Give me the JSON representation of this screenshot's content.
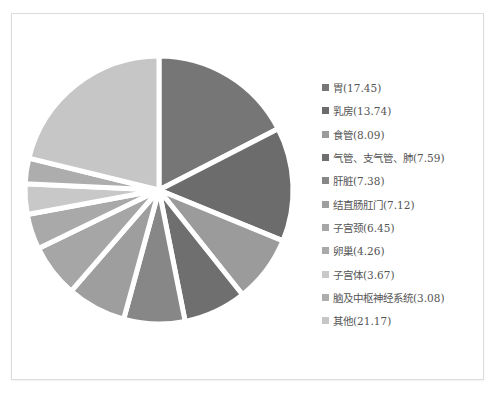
{
  "chart_data": {
    "type": "pie",
    "title": "",
    "unit": "%",
    "legend_position": "right",
    "center": [
      159,
      190
    ],
    "radius": 134,
    "slices": [
      {
        "label": "胃",
        "value": 17.45,
        "color": "#767676"
      },
      {
        "label": "乳房",
        "value": 13.74,
        "color": "#6c6c6c"
      },
      {
        "label": "食管",
        "value": 8.09,
        "color": "#9b9b9b"
      },
      {
        "label": "气管、支气管、肺",
        "value": 7.59,
        "color": "#6f6f6f"
      },
      {
        "label": "肝脏",
        "value": 7.38,
        "color": "#878787"
      },
      {
        "label": "结直肠肛门",
        "value": 7.12,
        "color": "#9e9e9e"
      },
      {
        "label": "子宫颈",
        "value": 6.45,
        "color": "#a6a6a6"
      },
      {
        "label": "卵巢",
        "value": 4.26,
        "color": "#a9a9a9"
      },
      {
        "label": "子宫体",
        "value": 3.67,
        "color": "#c8c8c8"
      },
      {
        "label": "脑及中枢神经系统",
        "value": 3.08,
        "color": "#adadad"
      },
      {
        "label": "其他",
        "value": 21.17,
        "color": "#c6c6c6"
      }
    ]
  },
  "legend": {
    "items": [
      "胃(17.45)",
      "乳房(13.74)",
      "食管(8.09)",
      "气管、支气管、肺(7.59)",
      "肝脏(7.38)",
      "结直肠肛门(7.12)",
      "子宫颈(6.45)",
      "卵巢(4.26)",
      "子宫体(3.67)",
      "脑及中枢神经系统(3.08)",
      "其他(21.17)"
    ]
  }
}
